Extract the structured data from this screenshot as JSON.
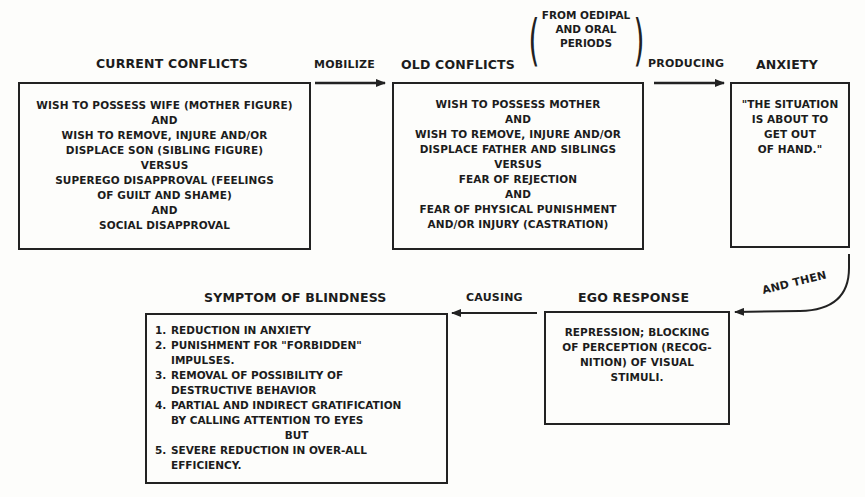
{
  "diagram": {
    "nodes": {
      "current_conflicts": {
        "title": "CURRENT CONFLICTS",
        "lines": [
          "WISH TO POSSESS WIFE (MOTHER FIGURE)",
          "AND",
          "WISH TO REMOVE, INJURE AND/OR",
          "DISPLACE SON (SIBLING FIGURE)",
          "VERSUS",
          "SUPEREGO DISAPPROVAL (FEELINGS",
          "OF GUILT AND SHAME)",
          "AND",
          "SOCIAL DISAPPROVAL"
        ]
      },
      "old_conflicts": {
        "title": "OLD CONFLICTS",
        "note_lines": [
          "FROM OEDIPAL",
          "AND ORAL",
          "PERIODS"
        ],
        "lines": [
          "WISH TO POSSESS MOTHER",
          "AND",
          "WISH TO REMOVE, INJURE AND/OR",
          "DISPLACE FATHER AND SIBLINGS",
          "VERSUS",
          "FEAR OF REJECTION",
          "AND",
          "FEAR OF PHYSICAL PUNISHMENT",
          "AND/OR INJURY (CASTRATION)"
        ]
      },
      "anxiety": {
        "title": "ANXIETY",
        "lines": [
          "\"THE SITUATION",
          "IS ABOUT TO",
          "GET OUT",
          "OF HAND.\""
        ]
      },
      "ego_response": {
        "title": "EGO RESPONSE",
        "lines": [
          "REPRESSION; BLOCKING",
          "OF PERCEPTION (RECOG-",
          "NITION) OF VISUAL",
          "STIMULI."
        ]
      },
      "symptom": {
        "title": "SYMPTOM OF BLINDNESS",
        "items": [
          {
            "num": "1.",
            "lines": [
              "REDUCTION IN ANXIETY"
            ]
          },
          {
            "num": "2.",
            "lines": [
              "PUNISHMENT FOR \"FORBIDDEN\"",
              "IMPULSES."
            ]
          },
          {
            "num": "3.",
            "lines": [
              "REMOVAL OF POSSIBILITY OF",
              "DESTRUCTIVE BEHAVIOR"
            ]
          },
          {
            "num": "4.",
            "lines": [
              "PARTIAL AND INDIRECT GRATIFICATION",
              "BY CALLING ATTENTION TO EYES"
            ]
          },
          {
            "num": "5.",
            "lines": [
              "SEVERE REDUCTION IN OVER-ALL",
              "EFFICIENCY."
            ]
          }
        ],
        "but_label": "BUT"
      }
    },
    "edges": {
      "mobilize": "MOBILIZE",
      "producing": "PRODUCING",
      "and_then": "AND THEN",
      "causing": "CAUSING"
    }
  }
}
